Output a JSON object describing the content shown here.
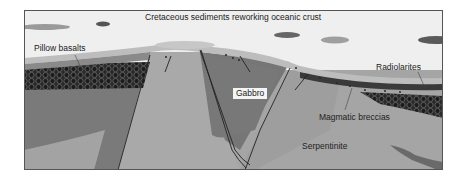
{
  "diagram": {
    "title": "Cretaceous sediments reworking oceanic crust",
    "labels": {
      "pillow_basalts": "Pillow basalts",
      "radiolarites": "Radiolarites",
      "gabbro": "Gabbro",
      "magmatic_breccias": "Magmatic breccias",
      "serpentinite": "Serpentinite"
    },
    "colors": {
      "sediment": "#efefef",
      "sediment_band": "#b9b9b9",
      "radiolarite": "#3a3a3a",
      "pillow_fill": "#1f1f1f",
      "pillow_stroke": "#5a5a5a",
      "gabbro": "#7b7b7b",
      "serpentinite": "#a5a5a5",
      "breccia": "#8a8a8a",
      "frame": "#555555",
      "fault": "#222222",
      "lens_dark": "#5c5c5c",
      "lens_light": "#9a9a9a"
    }
  }
}
